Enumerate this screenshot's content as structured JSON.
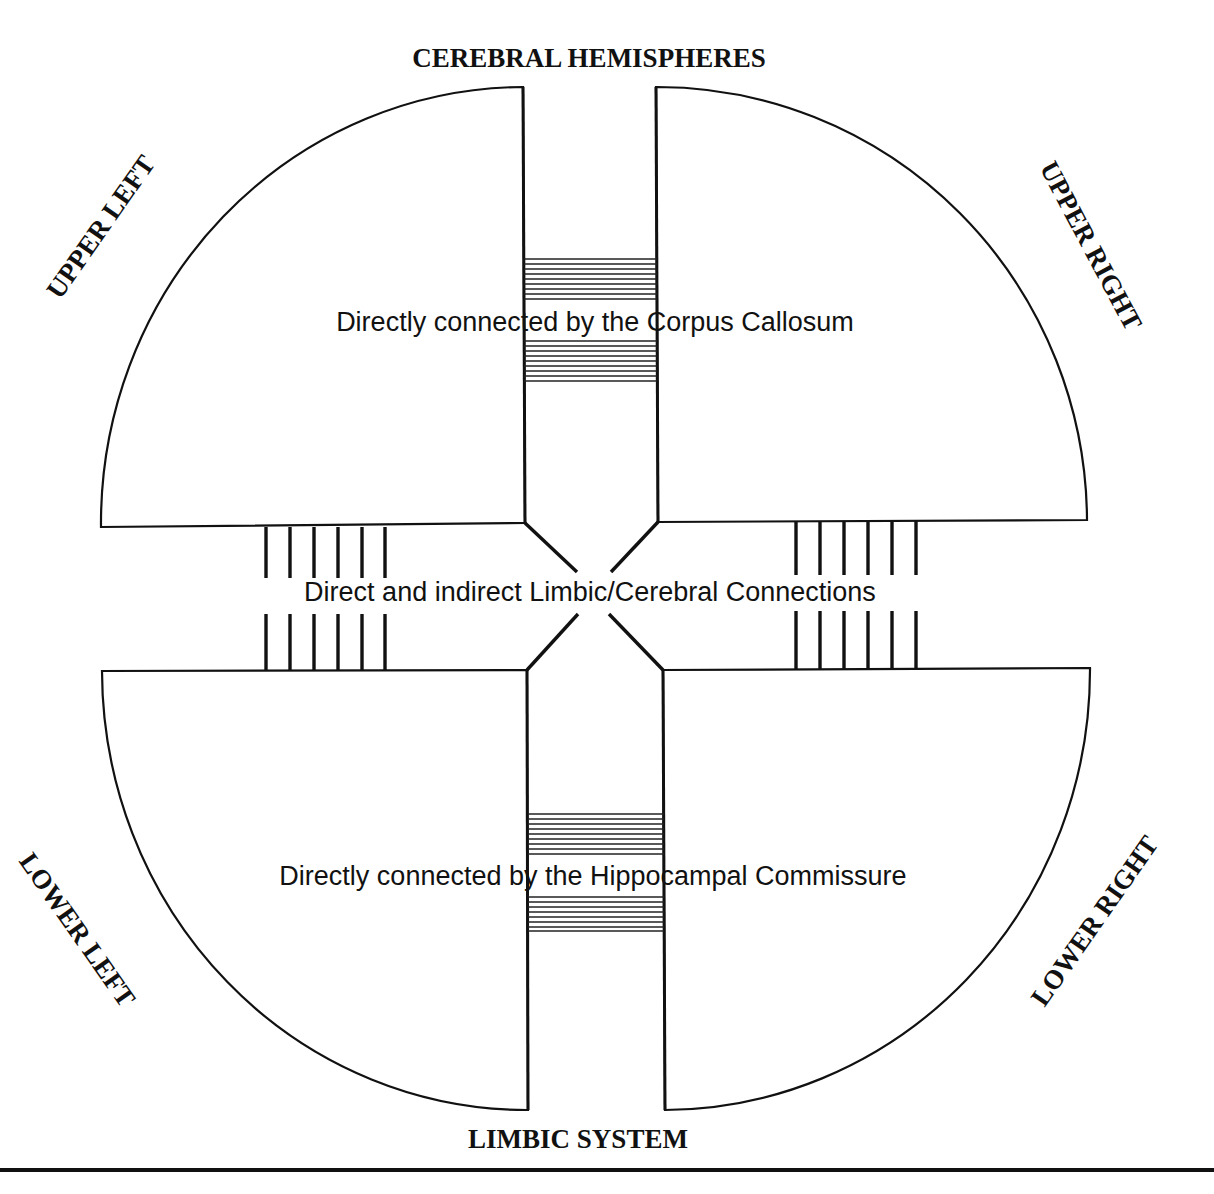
{
  "title_top": "CEREBRAL HEMISPHERES",
  "title_bottom": "LIMBIC SYSTEM",
  "quadrants": {
    "upper_left": "UPPER LEFT",
    "upper_right": "UPPER RIGHT",
    "lower_left": "LOWER LEFT",
    "lower_right": "LOWER RIGHT"
  },
  "connections": {
    "corpus_callosum": "Directly connected by the Corpus Callosum",
    "limbic_cerebral": "Direct and indirect Limbic/Cerebral Connections",
    "hippocampal_commissure": "Directly connected by the Hippocampal Commissure"
  },
  "colors": {
    "ink": "#111111",
    "background": "#ffffff"
  }
}
